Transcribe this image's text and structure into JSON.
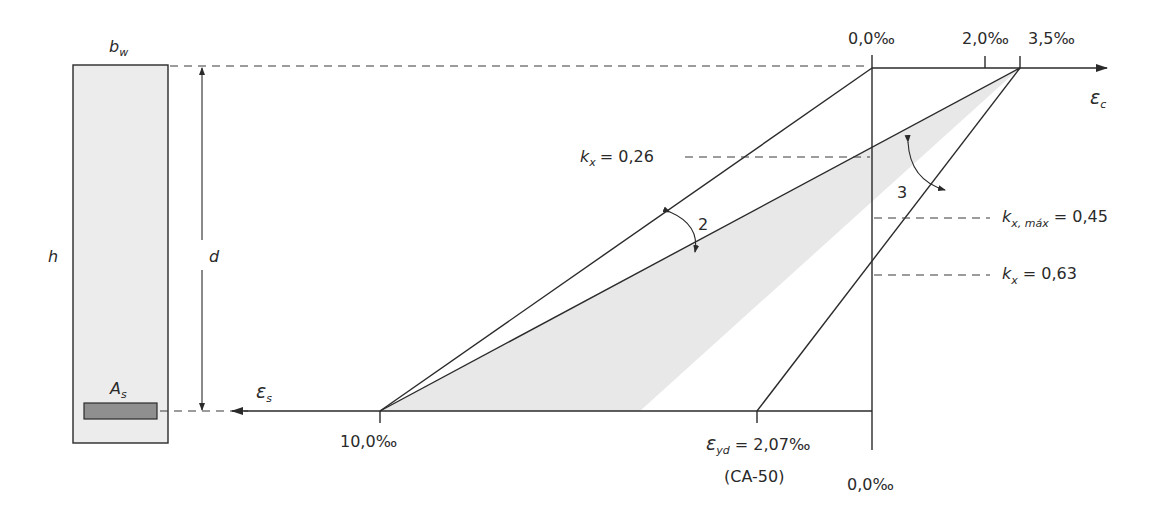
{
  "section": {
    "width_label": "b",
    "width_sub": "w",
    "height_label": "h",
    "depth_label": "d",
    "steel_label": "A",
    "steel_sub": "s",
    "fill_color": "#ececec",
    "steel_color": "#8f8f8f"
  },
  "axes": {
    "concrete_strain_label": "ε",
    "concrete_strain_sub": "c",
    "steel_strain_label": "ε",
    "steel_strain_sub": "s",
    "top_ticks": [
      "0,0‰",
      "2,0‰",
      "3,5‰"
    ],
    "bottom_ticks": {
      "steel_max": "10,0‰",
      "yield_symbol": "ε",
      "yield_sub": "yd",
      "yield_value": "= 2,07‰",
      "yield_note": "(CA-50)",
      "zero": "0,0‰"
    }
  },
  "annotations": {
    "kx1": {
      "symbol": "k",
      "sub": "x",
      "value": "= 0,26"
    },
    "kxmax": {
      "symbol": "k",
      "sub": "x, máx",
      "value": "= 0,45"
    },
    "kx2": {
      "symbol": "k",
      "sub": "x",
      "value": "= 0,63"
    },
    "domain2": "2",
    "domain3": "3"
  },
  "colors": {
    "line": "#2a2a2a",
    "shaded_region": "#e8e8e8"
  }
}
